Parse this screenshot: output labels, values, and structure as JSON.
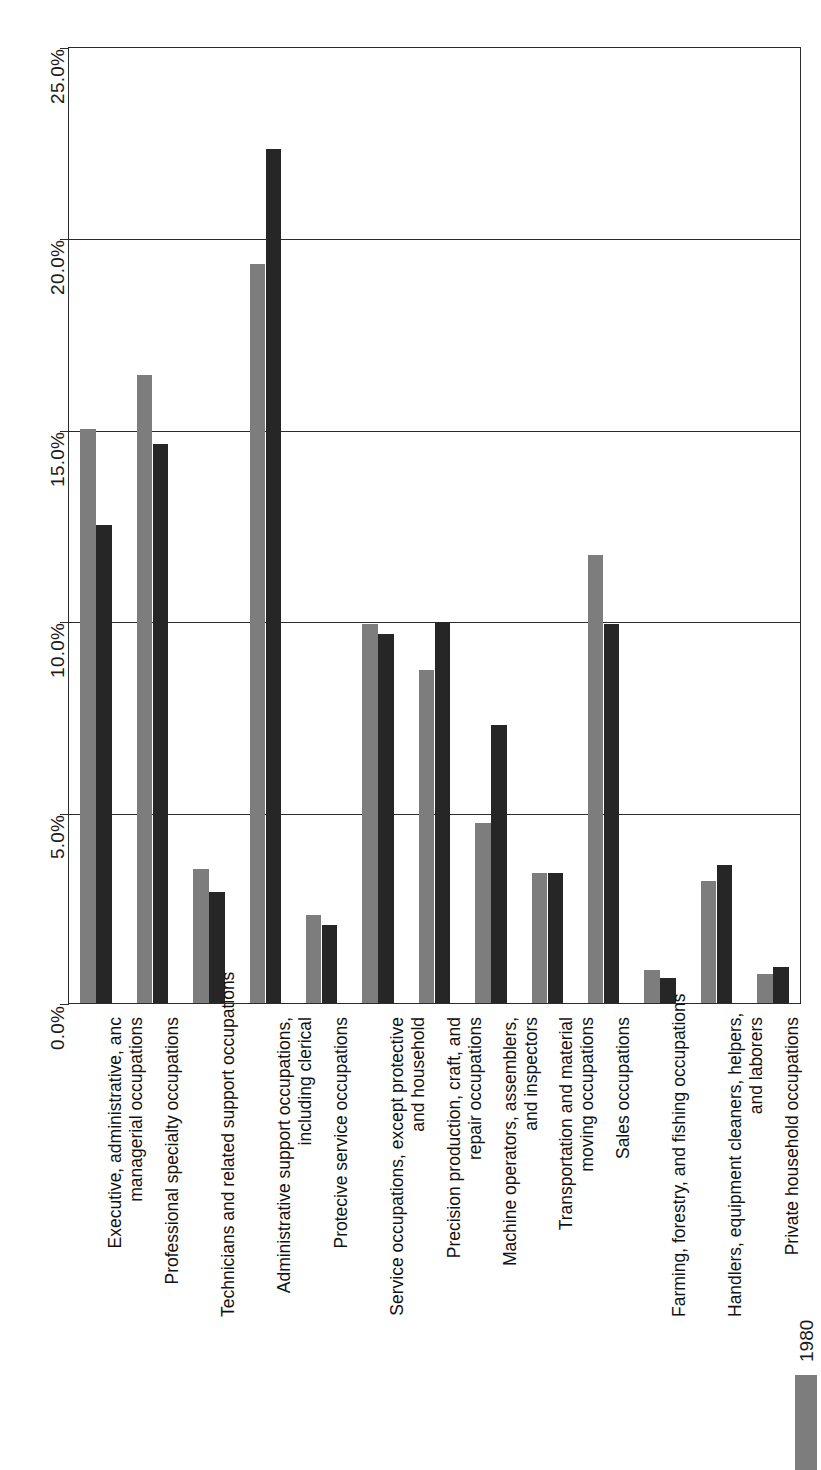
{
  "chart_data": {
    "type": "bar",
    "title": "",
    "subtitle": "",
    "xlabel": "",
    "ylabel": "",
    "orientation": "rotated-90",
    "grid": true,
    "legend_position": "bottom-right",
    "ylim": [
      0.0,
      25.0
    ],
    "ytick_labels": [
      "0.0%",
      "5.0%",
      "10.0%",
      "15.0%",
      "20.0%",
      "25.0%"
    ],
    "ytick_values": [
      0.0,
      5.0,
      10.0,
      15.0,
      20.0,
      25.0
    ],
    "categories": [
      "Executive, administrative, anc\nmanagerial occupations",
      "Professional specialty occupations",
      "Technicians and related support occupations",
      "Administrative support occupations,\nincluding clerical",
      "Protecive service occupations",
      "Service occupations, except protective\nand household",
      "Precision production, craft, and\nrepair occupations",
      "Machine operators, assemblers,\nand inspectors",
      "Transportation and material\nmoving occupations",
      "Sales occupations",
      "Farming, forestry, and fishing occupations",
      "Handlers, equipment cleaners, helpers,\nand laborers",
      "Private household occupations"
    ],
    "series": [
      {
        "name": "1980",
        "color": "#7d7d7d",
        "values": [
          15.0,
          16.4,
          3.5,
          19.3,
          2.3,
          9.9,
          8.7,
          4.7,
          3.4,
          11.7,
          0.85,
          3.2,
          0.75
        ]
      },
      {
        "name": "",
        "color": "#262626",
        "values": [
          12.5,
          14.6,
          2.9,
          22.3,
          2.05,
          9.65,
          9.95,
          7.25,
          3.4,
          9.9,
          0.65,
          3.6,
          0.95
        ]
      }
    ]
  },
  "axis": {
    "ticks": [
      {
        "label": "0.0%",
        "value": 0.0
      },
      {
        "label": "5.0%",
        "value": 5.0
      },
      {
        "label": "10.0%",
        "value": 10.0
      },
      {
        "label": "15.0%",
        "value": 15.0
      },
      {
        "label": "20.0%",
        "value": 20.0
      },
      {
        "label": "25.0%",
        "value": 25.0
      }
    ]
  },
  "legend": {
    "entries": [
      {
        "label": "1980",
        "color": "#7d7d7d"
      }
    ]
  },
  "colors": {
    "series_1980": "#7d7d7d",
    "series_other": "#262626",
    "axis": "#2b2b2b",
    "background": "#ffffff"
  }
}
